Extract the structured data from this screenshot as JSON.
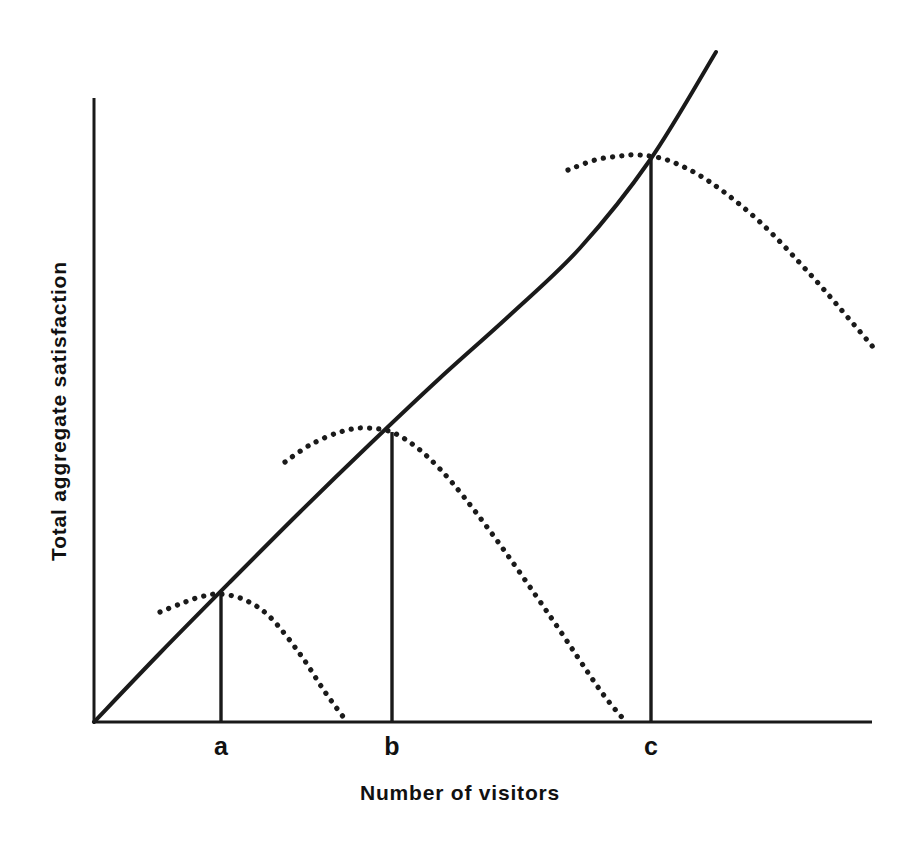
{
  "chart_data": {
    "type": "line",
    "title": "",
    "subtitle": "",
    "xlabel": "Number of visitors",
    "ylabel": "Total aggregate satisfaction",
    "grid": false,
    "legend": null,
    "axis_style": "open axes, no numeric ticks, arrowless",
    "xlim": [
      0,
      1
    ],
    "ylim": [
      0,
      1
    ],
    "xticks": [
      {
        "label": "a",
        "x_px": 221,
        "x_norm": 0.163
      },
      {
        "label": "b",
        "x_px": 392,
        "x_norm": 0.383
      },
      {
        "label": "c",
        "x_px": 651,
        "x_norm": 0.716
      }
    ],
    "yticks": [],
    "annotations": [
      "Solid curve: total aggregate satisfaction rising with number of visitors (concave, diminishing returns)",
      "Three dotted curves branch off the solid curve and peak then decline, each peak marked by a vertical drop line labelled a, b and c"
    ],
    "series": [
      {
        "name": "Aggregate satisfaction (rising)",
        "style": "solid",
        "points_px": [
          [
            94,
            722
          ],
          [
            160,
            653
          ],
          [
            230,
            582
          ],
          [
            300,
            512
          ],
          [
            370,
            444
          ],
          [
            440,
            378
          ],
          [
            510,
            315
          ],
          [
            580,
            248
          ],
          [
            650,
            160
          ],
          [
            716,
            52
          ]
        ]
      },
      {
        "name": "Carrying-capacity curve a",
        "style": "dotted",
        "peak_px": [
          220,
          594
        ],
        "peak_label": "a",
        "points_px": [
          [
            160,
            612
          ],
          [
            180,
            604
          ],
          [
            200,
            597
          ],
          [
            220,
            594
          ],
          [
            245,
            600
          ],
          [
            270,
            617
          ],
          [
            300,
            654
          ],
          [
            325,
            692
          ],
          [
            347,
            722
          ]
        ]
      },
      {
        "name": "Carrying-capacity curve b",
        "style": "dotted",
        "peak_px": [
          368,
          428
        ],
        "peak_label": "b",
        "points_px": [
          [
            285,
            462
          ],
          [
            310,
            445
          ],
          [
            340,
            432
          ],
          [
            368,
            428
          ],
          [
            400,
            436
          ],
          [
            440,
            469
          ],
          [
            490,
            531
          ],
          [
            550,
            616
          ],
          [
            600,
            690
          ],
          [
            626,
            722
          ]
        ]
      },
      {
        "name": "Carrying-capacity curve c",
        "style": "dotted",
        "peak_px": [
          640,
          155
        ],
        "peak_label": "c",
        "points_px": [
          [
            568,
            170
          ],
          [
            595,
            160
          ],
          [
            620,
            156
          ],
          [
            640,
            155
          ],
          [
            670,
            161
          ],
          [
            710,
            182
          ],
          [
            760,
            222
          ],
          [
            810,
            274
          ],
          [
            850,
            320
          ],
          [
            873,
            347
          ]
        ]
      }
    ],
    "drop_lines": [
      {
        "label": "a",
        "x_px": 221,
        "top_px": 595,
        "bottom_px": 722
      },
      {
        "label": "b",
        "x_px": 392,
        "top_px": 432,
        "bottom_px": 722
      },
      {
        "label": "c",
        "x_px": 651,
        "top_px": 157,
        "bottom_px": 722
      }
    ],
    "colors": {
      "ink": "#1a1a1a",
      "background": "#ffffff"
    }
  },
  "axes": {
    "x_axis": {
      "x1": 94,
      "y1": 722,
      "x2": 872,
      "y2": 722
    },
    "y_axis": {
      "x1": 94,
      "y1": 98,
      "x2": 94,
      "y2": 722
    }
  },
  "labels": {
    "tick_a": "a",
    "tick_b": "b",
    "tick_c": "c",
    "x_axis_title": "Number of visitors",
    "y_axis_title": "Total aggregate satisfaction"
  }
}
